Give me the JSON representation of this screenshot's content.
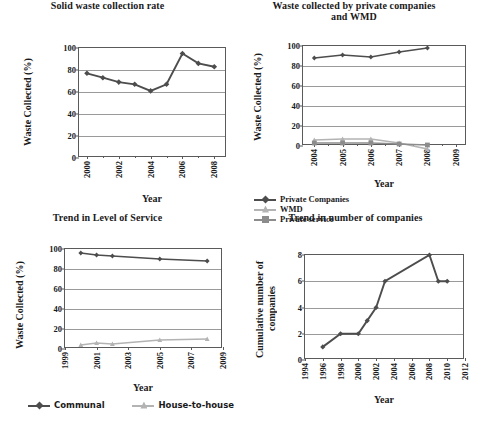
{
  "figure": {
    "background": "#ffffff",
    "dark_color": "#4d4d4d",
    "light_color": "#b3b3b3",
    "axis_color": "#5a5a5a",
    "grid_color": "#9a9a9a"
  },
  "charts": [
    {
      "id": "solid-waste-collection-rate",
      "chart_data": {
        "type": "line",
        "title": "Solid waste collection  rate",
        "xlabel": "Year",
        "ylabel": "Waste Collected (%)",
        "xlim": [
          1999.5,
          2008.8
        ],
        "ylim": [
          0,
          100
        ],
        "yticks": [
          0,
          20,
          40,
          60,
          80,
          100
        ],
        "xticks": [
          2000,
          2002,
          2004,
          2006,
          2008
        ],
        "xticklabels": [
          "2000",
          "2002",
          "2004",
          "2006",
          "2008"
        ],
        "grid": true,
        "legend": null,
        "x": [
          2000,
          2001,
          2002,
          2003,
          2004,
          2005,
          2006,
          2007,
          2008
        ],
        "series": [
          {
            "name": "Collection rate",
            "color": "#4d4d4d",
            "marker": "diamond",
            "values": [
              77,
              73,
              69,
              67,
              61,
              67,
              95,
              86,
              83
            ]
          }
        ]
      }
    },
    {
      "id": "waste-collected-private-companies-wmd",
      "chart_data": {
        "type": "line",
        "title": "Waste collected by private companies and  WMD",
        "title_line1": "Waste collected by private companies",
        "title_line2": "and  WMD",
        "xlabel": "Year",
        "ylabel": "Waste Collected (%)",
        "xlim": [
          2003.6,
          2009.4
        ],
        "ylim": [
          0,
          100
        ],
        "yticks": [
          0,
          20,
          40,
          60,
          80,
          100
        ],
        "xticks": [
          2004,
          2005,
          2006,
          2007,
          2008,
          2009
        ],
        "xticklabels": [
          "2004",
          "2005",
          "2006",
          "2007",
          "2008",
          "2009"
        ],
        "grid": true,
        "legend_position": "bottom",
        "x": [
          2004,
          2005,
          2006,
          2007,
          2008
        ],
        "series": [
          {
            "name": "Private Companies",
            "color": "#4d4d4d",
            "marker": "diamond",
            "values": [
              88,
              91,
              89,
              94,
              98
            ]
          },
          {
            "name": "WMD",
            "color": "#b3b3b3",
            "marker": "triangle",
            "values": [
              6,
              7,
              7,
              3,
              -3
            ]
          },
          {
            "name": "Private service",
            "color": "#8c8c8c",
            "marker": "square",
            "values": [
              3,
              3,
              3,
              2,
              1
            ]
          }
        ]
      }
    },
    {
      "id": "trend-in-level-of-service",
      "chart_data": {
        "type": "line",
        "title": "Trend in Level of Service",
        "xlabel": "Year",
        "ylabel": "Waste Collected (%)",
        "xlim": [
          1999,
          2009
        ],
        "ylim": [
          0,
          100
        ],
        "yticks": [
          0,
          20,
          40,
          60,
          80,
          100
        ],
        "xticks": [
          1999,
          2001,
          2003,
          2005,
          2007,
          2009
        ],
        "xticklabels": [
          "1999",
          "2001",
          "2003",
          "2005",
          "2007",
          "2009"
        ],
        "grid": true,
        "legend_position": "bottom",
        "x": [
          2000,
          2001,
          2002,
          2005,
          2008
        ],
        "series": [
          {
            "name": "Communal",
            "color": "#4d4d4d",
            "marker": "diamond",
            "values": [
              96,
              94,
              93,
              90,
              88
            ]
          },
          {
            "name": "House-to-house",
            "color": "#b3b3b3",
            "marker": "triangle",
            "values": [
              4,
              6,
              5,
              9,
              10
            ]
          }
        ]
      }
    },
    {
      "id": "trend-in-number-of-companies",
      "chart_data": {
        "type": "line",
        "title": "Trend in number of companies",
        "xlabel": "Year",
        "ylabel": "Cumulative number of companies",
        "ylabel_line1": "Cumulative number of",
        "ylabel_line2": "companies",
        "xlim": [
          1994,
          2012
        ],
        "ylim": [
          0,
          8
        ],
        "yticks": [
          0,
          2,
          4,
          6,
          8
        ],
        "xticks": [
          1994,
          1996,
          1998,
          2000,
          2002,
          2004,
          2006,
          2008,
          2010,
          2012
        ],
        "xticklabels": [
          "1994",
          "1996",
          "1998",
          "2000",
          "2002",
          "2004",
          "2006",
          "2008",
          "2010",
          "2012"
        ],
        "grid": true,
        "legend": null,
        "x": [
          1996,
          1998,
          2000,
          2001,
          2002,
          2003,
          2008,
          2009,
          2010
        ],
        "series": [
          {
            "name": "Cumulative number of companies",
            "color": "#4d4d4d",
            "marker": "diamond",
            "values": [
              1,
              2,
              2,
              3,
              4,
              6,
              8,
              6,
              6
            ]
          }
        ]
      }
    }
  ]
}
